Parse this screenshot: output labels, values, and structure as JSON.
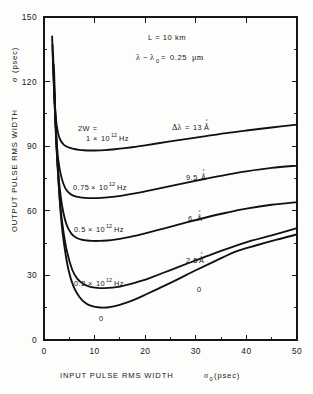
{
  "figure": {
    "background_color": "#fdfdfc",
    "ink_color": "#15161a"
  },
  "axes": {
    "y": {
      "title_text": "OUTPUT PULSE RMS WIDTH",
      "title_symbol": "σ",
      "title_units": "(psec)",
      "ticks": [
        "0",
        "30",
        "60",
        "90",
        "120",
        "150"
      ],
      "tick_values": [
        0,
        30,
        60,
        90,
        120,
        150
      ],
      "minor_tick_values": [
        15,
        45,
        75,
        105,
        135
      ],
      "range": [
        0,
        150
      ]
    },
    "x": {
      "title_text": "INPUT PULSE RMS WIDTH",
      "title_symbol": "σ",
      "title_subscript": "0",
      "title_units": "(psec)",
      "ticks": [
        "0",
        "10",
        "20",
        "30",
        "40",
        "50"
      ],
      "tick_values": [
        0,
        10,
        20,
        30,
        40,
        50
      ],
      "minor_tick_values": [
        5,
        15,
        25,
        35,
        45
      ],
      "range": [
        0,
        50
      ]
    }
  },
  "annotations": {
    "length": {
      "symbol": "L",
      "equals": "=",
      "value": "10 km",
      "full": "L = 10 km"
    },
    "wavelength": {
      "symbol": "λ",
      "minus": "−",
      "symbol_sub": "λ",
      "subscript": "0",
      "equals": "=",
      "value": "0.25",
      "units": "μm",
      "full": "λ − λ0 = 0.25 μm"
    },
    "source_width_header": "2W ="
  },
  "curve_labels": {
    "left": [
      {
        "id": "lbl-2w-1e12",
        "prefix": "1",
        "times": "×",
        "mantissa": "10",
        "exponent": "12",
        "units": "Hz",
        "full": "1 × 10¹² Hz"
      },
      {
        "id": "lbl-2w-075e12",
        "prefix": "0.75",
        "times": "×",
        "mantissa": "10",
        "exponent": "12",
        "units": "Hz",
        "full": "0.75 × 10¹² Hz"
      },
      {
        "id": "lbl-2w-05e12",
        "prefix": "0.5",
        "times": "×",
        "mantissa": "10",
        "exponent": "12",
        "units": "Hz",
        "full": "0.5 × 10¹² Hz"
      },
      {
        "id": "lbl-2w-02e12",
        "prefix": "0.2",
        "times": "×",
        "mantissa": "10",
        "exponent": "12",
        "units": "Hz",
        "full": "0.2 × 10¹² Hz"
      },
      {
        "id": "lbl-2w-zero",
        "full": "0"
      }
    ],
    "right": [
      {
        "id": "lbl-dl-13",
        "symbol": "Δλ",
        "equals": "=",
        "value": "13",
        "units": "Å",
        "full": "Δλ = 13 Å"
      },
      {
        "id": "lbl-dl-95",
        "value": "9.5",
        "units": "Å",
        "full": "9.5 Å"
      },
      {
        "id": "lbl-dl-6",
        "value": "6",
        "units": "Å",
        "full": "6 Å"
      },
      {
        "id": "lbl-dl-25",
        "value": "2.5",
        "units": "Å",
        "full": "2.5 Å"
      },
      {
        "id": "lbl-dl-zero",
        "full": "0"
      }
    ]
  },
  "chart_data": {
    "type": "line",
    "title": "",
    "subtitle": "",
    "xlabel": "INPUT PULSE RMS WIDTH σ0 (psec)",
    "ylabel": "OUTPUT PULSE RMS WIDTH σ (psec)",
    "xlim": [
      0,
      50
    ],
    "ylim": [
      0,
      150
    ],
    "xticks": [
      0,
      10,
      20,
      30,
      40,
      50
    ],
    "yticks": [
      0,
      30,
      60,
      90,
      120,
      150
    ],
    "grid": false,
    "legend": "inline-curve-labels",
    "annotations": [
      "L = 10 km",
      "λ − λ0 = 0.25 μm",
      "2W ="
    ],
    "series": [
      {
        "name": "2W = 1 × 10¹² Hz",
        "delta_lambda_angstrom": 13,
        "source_width_hz": 1000000000000.0,
        "x": [
          1.6,
          1.8,
          2.0,
          2.3,
          2.7,
          3.2,
          4.0,
          5.0,
          6.0,
          7.0,
          8.0,
          9.0,
          10.0,
          12.0,
          14.0,
          16.0,
          18.0,
          20.0,
          24.0,
          28.0,
          32.0,
          36.0,
          40.0,
          45.0,
          50.0
        ],
        "y": [
          141.0,
          127.0,
          116.0,
          104.0,
          97.0,
          93.0,
          90.5,
          89.3,
          88.7,
          88.3,
          88.1,
          88.0,
          88.0,
          88.2,
          88.6,
          89.1,
          89.7,
          90.4,
          91.9,
          93.3,
          94.7,
          96.1,
          97.3,
          98.7,
          100.0
        ]
      },
      {
        "name": "2W = 0.75 × 10¹² Hz",
        "delta_lambda_angstrom": 9.5,
        "source_width_hz": 750000000000.0,
        "x": [
          1.7,
          1.9,
          2.1,
          2.4,
          2.8,
          3.4,
          4.2,
          5.2,
          6.2,
          7.2,
          8.2,
          9.2,
          10.5,
          12.0,
          14.0,
          16.0,
          18.0,
          20.0,
          24.0,
          28.0,
          32.0,
          36.0,
          40.0,
          45.0,
          50.0
        ],
        "y": [
          137.0,
          122.0,
          110.0,
          96.0,
          84.0,
          76.0,
          70.5,
          67.8,
          66.7,
          66.2,
          66.0,
          65.9,
          65.9,
          66.1,
          66.6,
          67.3,
          68.1,
          69.0,
          71.0,
          73.0,
          74.9,
          76.7,
          78.3,
          79.9,
          81.0
        ]
      },
      {
        "name": "2W = 0.5 × 10¹² Hz",
        "delta_lambda_angstrom": 6,
        "source_width_hz": 500000000000.0,
        "x": [
          1.8,
          2.0,
          2.2,
          2.5,
          3.0,
          3.6,
          4.4,
          5.4,
          6.4,
          7.4,
          8.5,
          9.5,
          11.0,
          12.5,
          14.0,
          16.0,
          18.0,
          20.0,
          24.0,
          28.0,
          32.0,
          36.0,
          40.0,
          45.0,
          50.0
        ],
        "y": [
          133.0,
          117.0,
          104.0,
          88.0,
          73.0,
          62.0,
          54.0,
          49.4,
          47.5,
          46.6,
          46.2,
          46.0,
          46.0,
          46.2,
          46.6,
          47.4,
          48.4,
          49.5,
          52.0,
          54.5,
          56.9,
          59.1,
          61.0,
          62.8,
          64.0
        ]
      },
      {
        "name": "2W = 0.2 × 10¹² Hz",
        "delta_lambda_angstrom": 2.5,
        "source_width_hz": 200000000000.0,
        "x": [
          1.9,
          2.1,
          2.4,
          2.7,
          3.2,
          3.8,
          4.6,
          5.6,
          6.6,
          7.8,
          9.0,
          10.5,
          12.0,
          13.5,
          15.0,
          17.0,
          19.0,
          21.0,
          25.0,
          29.0,
          33.0,
          37.0,
          41.0,
          45.0,
          50.0
        ],
        "y": [
          128.0,
          112.0,
          95.0,
          80.0,
          63.0,
          51.0,
          40.5,
          32.5,
          28.4,
          26.0,
          24.8,
          24.2,
          24.1,
          24.3,
          24.8,
          25.9,
          27.3,
          28.9,
          32.5,
          36.1,
          39.7,
          43.0,
          46.1,
          48.6,
          52.0
        ]
      },
      {
        "name": "2W = 0",
        "delta_lambda_angstrom": 0,
        "source_width_hz": 0,
        "x": [
          2.0,
          2.2,
          2.5,
          2.9,
          3.4,
          4.0,
          4.8,
          5.8,
          7.0,
          8.2,
          9.5,
          11.0,
          12.5,
          14.0,
          16.0,
          18.0,
          20.0,
          23.0,
          26.0,
          30.0,
          34.0,
          38.0,
          42.0,
          46.0,
          50.0
        ],
        "y": [
          125.0,
          108.0,
          90.0,
          73.0,
          56.0,
          44.0,
          33.0,
          25.0,
          20.0,
          17.2,
          15.7,
          15.1,
          15.1,
          15.7,
          17.1,
          18.9,
          21.0,
          24.3,
          27.7,
          32.4,
          36.9,
          41.2,
          44.0,
          46.6,
          49.0
        ]
      }
    ]
  }
}
